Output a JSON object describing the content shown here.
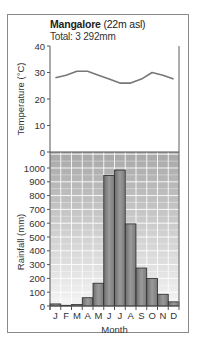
{
  "chart_data": [
    {
      "type": "line",
      "title": "Mangalore (22m asl)",
      "subtitle": "Total: 3 292mm",
      "xlabel": "Month",
      "ylabel": "Temperature (°C)",
      "ylim": [
        0,
        40
      ],
      "yticks": [
        0,
        10,
        20,
        30,
        40
      ],
      "categories": [
        "J",
        "F",
        "M",
        "A",
        "M",
        "J",
        "J",
        "A",
        "S",
        "O",
        "N",
        "D"
      ],
      "series": [
        {
          "name": "Temperature",
          "values": [
            28,
            29,
            30.5,
            30.5,
            29,
            27.5,
            26,
            26,
            27.5,
            30,
            29,
            27.5
          ],
          "color": "#777777"
        }
      ],
      "grid": false
    },
    {
      "type": "bar",
      "xlabel": "Month",
      "ylabel": "Rainfall (mm)",
      "ylim": [
        0,
        1100
      ],
      "yticks": [
        0,
        100,
        200,
        300,
        400,
        500,
        600,
        700,
        800,
        900,
        1000
      ],
      "categories": [
        "J",
        "F",
        "M",
        "A",
        "M",
        "J",
        "J",
        "A",
        "S",
        "O",
        "N",
        "D"
      ],
      "series": [
        {
          "name": "Rainfall",
          "values": [
            15,
            5,
            10,
            60,
            165,
            945,
            985,
            595,
            275,
            200,
            85,
            30
          ],
          "color": "#8c8c8c"
        }
      ],
      "grid": true
    }
  ],
  "header": {
    "city": "Mangalore",
    "elevation": "(22m asl)",
    "total": "Total: 3 292mm"
  },
  "axes": {
    "temp_label": "Temperature (°C)",
    "rain_label": "Rainfall (mm)",
    "x_label": "Month",
    "temp_ticks": [
      "40",
      "30",
      "20",
      "10",
      "0"
    ],
    "rain_ticks": [
      "1000",
      "900",
      "800",
      "700",
      "600",
      "500",
      "400",
      "300",
      "200",
      "100",
      "0"
    ],
    "months": [
      "J",
      "F",
      "M",
      "A",
      "M",
      "J",
      "J",
      "A",
      "S",
      "O",
      "N",
      "D"
    ]
  }
}
